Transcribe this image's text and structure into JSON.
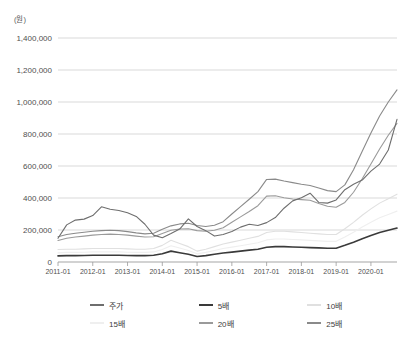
{
  "chart_data": {
    "type": "line",
    "title": "",
    "subtitle": "",
    "unit_label": "(원)",
    "xlabel": "",
    "ylabel": "",
    "ylim": [
      0,
      1400000
    ],
    "ytick_values": [
      0,
      200000,
      400000,
      600000,
      800000,
      1000000,
      1200000,
      1400000
    ],
    "ytick_labels": [
      "0",
      "200,000",
      "400,000",
      "600,000",
      "800,000",
      "1,000,000",
      "1,200,000",
      "1,400,000"
    ],
    "grid": true,
    "legend_position": "bottom",
    "x": [
      "2011-01",
      "2011-04",
      "2011-07",
      "2011-10",
      "2012-01",
      "2012-04",
      "2012-07",
      "2012-10",
      "2013-01",
      "2013-04",
      "2013-07",
      "2013-10",
      "2014-01",
      "2014-04",
      "2014-07",
      "2014-10",
      "2015-01",
      "2015-04",
      "2015-07",
      "2015-10",
      "2016-01",
      "2016-04",
      "2016-07",
      "2016-10",
      "2017-01",
      "2017-04",
      "2017-07",
      "2017-10",
      "2018-01",
      "2018-04",
      "2018-07",
      "2018-10",
      "2019-01",
      "2019-04",
      "2019-07",
      "2019-10",
      "2020-01",
      "2020-04",
      "2020-07",
      "2020-10"
    ],
    "xtick_labels": [
      "2011-01",
      "2012-01",
      "2013-01",
      "2014-01",
      "2015-01",
      "2016-01",
      "2017-01",
      "2018-01",
      "2019-01",
      "2020-01"
    ],
    "colors": {
      "주가": "#6e6e6e",
      "5배": "#3a3a3a",
      "10배": "#e0e0e0",
      "15배": "#efefef",
      "20배": "#9a9a9a",
      "25배": "#8a8a8a"
    },
    "series": [
      {
        "name": "주가",
        "color": "#6e6e6e",
        "width": 1.1,
        "values": [
          148000,
          232000,
          262000,
          268000,
          290000,
          345000,
          330000,
          322000,
          308000,
          285000,
          236000,
          168000,
          152000,
          178000,
          206000,
          270000,
          222000,
          196000,
          162000,
          172000,
          190000,
          218000,
          236000,
          228000,
          246000,
          278000,
          336000,
          382000,
          402000,
          430000,
          372000,
          368000,
          388000,
          452000,
          486000,
          512000,
          568000,
          612000,
          700000,
          892000
        ]
      },
      {
        "name": "5배",
        "color": "#3a3a3a",
        "width": 1.6,
        "values": [
          38000,
          40000,
          40000,
          41000,
          42000,
          42000,
          42000,
          42000,
          41000,
          40000,
          40000,
          42000,
          52000,
          68000,
          58000,
          48000,
          34000,
          40000,
          48000,
          56000,
          62000,
          68000,
          74000,
          80000,
          92000,
          96000,
          96000,
          94000,
          92000,
          90000,
          88000,
          86000,
          86000,
          104000,
          124000,
          146000,
          166000,
          184000,
          198000,
          212000
        ]
      },
      {
        "name": "10배",
        "color": "#e0e0e0",
        "width": 1.1,
        "values": [
          78000,
          80000,
          80000,
          82000,
          84000,
          84000,
          84000,
          84000,
          82000,
          80000,
          80000,
          84000,
          104000,
          136000,
          116000,
          96000,
          68000,
          80000,
          96000,
          112000,
          124000,
          136000,
          148000,
          160000,
          184000,
          192000,
          192000,
          188000,
          184000,
          180000,
          176000,
          172000,
          172000,
          208000,
          248000,
          292000,
          332000,
          368000,
          396000,
          424000
        ]
      },
      {
        "name": "15배",
        "color": "#efefef",
        "width": 1.1,
        "values": [
          57000,
          60000,
          60000,
          61000,
          63000,
          63000,
          63000,
          63000,
          61000,
          60000,
          60000,
          63000,
          78000,
          102000,
          87000,
          72000,
          51000,
          60000,
          72000,
          84000,
          93000,
          102000,
          111000,
          120000,
          138000,
          144000,
          144000,
          141000,
          138000,
          135000,
          132000,
          129000,
          129000,
          156000,
          186000,
          219000,
          249000,
          276000,
          297000,
          318000
        ]
      },
      {
        "name": "20배",
        "color": "#9a9a9a",
        "width": 1.1,
        "values": [
          134000,
          148000,
          156000,
          162000,
          168000,
          172000,
          174000,
          172000,
          168000,
          162000,
          156000,
          158000,
          178000,
          198000,
          206000,
          208000,
          196000,
          192000,
          198000,
          214000,
          248000,
          282000,
          316000,
          352000,
          412000,
          414000,
          402000,
          394000,
          390000,
          386000,
          366000,
          348000,
          342000,
          372000,
          436000,
          520000,
          612000,
          706000,
          792000,
          866000
        ]
      },
      {
        "name": "25배",
        "color": "#8a8a8a",
        "width": 1.1,
        "values": [
          158000,
          172000,
          180000,
          186000,
          192000,
          196000,
          198000,
          196000,
          190000,
          182000,
          176000,
          180000,
          204000,
          226000,
          238000,
          242000,
          228000,
          222000,
          230000,
          252000,
          300000,
          346000,
          392000,
          440000,
          516000,
          518000,
          506000,
          496000,
          486000,
          478000,
          462000,
          446000,
          440000,
          482000,
          576000,
          692000,
          806000,
          912000,
          1000000,
          1076000
        ]
      }
    ]
  },
  "legend": {
    "rows": [
      [
        {
          "label": "주가",
          "color": "#6e6e6e"
        },
        {
          "label": "5배",
          "color": "#3a3a3a"
        },
        {
          "label": "10배",
          "color": "#e0e0e0"
        }
      ],
      [
        {
          "label": "15배",
          "color": "#efefef"
        },
        {
          "label": "20배",
          "color": "#9a9a9a"
        },
        {
          "label": "25배",
          "color": "#8a8a8a"
        }
      ]
    ]
  },
  "axis": {
    "grid_color": "#c8c8c8",
    "axis_color": "#9b9b9b",
    "tick_color": "#9b9b9b"
  }
}
